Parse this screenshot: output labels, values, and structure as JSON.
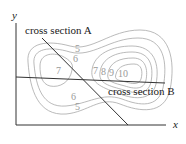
{
  "diagram": {
    "type": "contour-map",
    "axes": {
      "x_label": "x",
      "y_label": "y"
    },
    "cross_sections": [
      {
        "id": "A",
        "label": "cross section A"
      },
      {
        "id": "B",
        "label": "cross section B"
      }
    ],
    "contour_labels": {
      "left_top": [
        "5",
        "6"
      ],
      "left_center": "7",
      "left_bottom": [
        "6",
        "5"
      ],
      "right_row": [
        "7",
        "8",
        "9",
        "10"
      ]
    },
    "colors": {
      "axis": "#333333",
      "contour": "#a8a8a8",
      "section_line": "#333333",
      "contour_label": "#9a9a9a"
    }
  }
}
